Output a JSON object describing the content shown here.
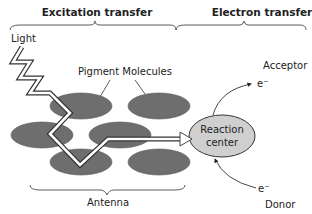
{
  "headers": {
    "excitation": "Excitation transfer",
    "electron": "Electron transfer"
  },
  "labels": {
    "light": "Light",
    "pigment": "Pigment Molecules",
    "antenna": "Antenna",
    "reaction_line1": "Reaction",
    "reaction_line2": "center",
    "acceptor": "Acceptor",
    "donor": "Donor",
    "electron_top": "e⁻",
    "electron_bottom": "e⁻"
  },
  "colors": {
    "pigment": "#6e6e6e",
    "reaction_center": "#cfcfcf",
    "stroke": "#333333"
  }
}
